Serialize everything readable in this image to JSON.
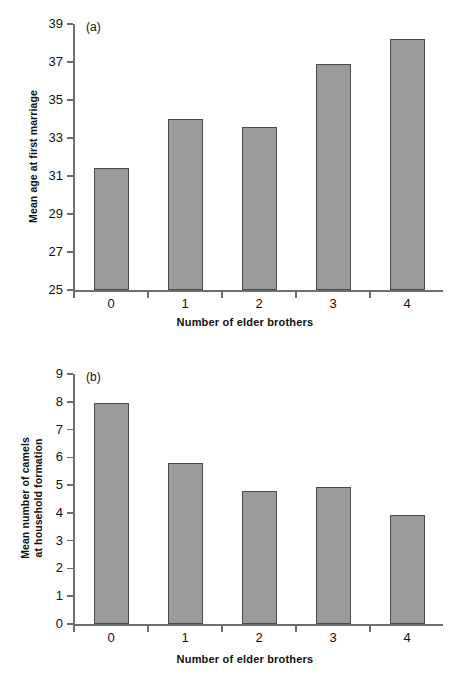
{
  "figure": {
    "panels": [
      {
        "tag": "(a)",
        "ytitle": "Mean age at first marriage",
        "xtitle": "Number of elder brothers"
      },
      {
        "tag": "(b)",
        "ytitle": "Mean number  of camels\nat household formation",
        "xtitle": "Number of elder brothers"
      }
    ]
  },
  "chart_data": [
    {
      "type": "bar",
      "panel": "(a)",
      "title": "",
      "xlabel": "Number of elder brothers",
      "ylabel": "Mean age at first marriage",
      "categories": [
        "0",
        "1",
        "2",
        "3",
        "4"
      ],
      "values": [
        31.4,
        34.0,
        33.6,
        36.9,
        38.2
      ],
      "ylim": [
        25,
        39
      ],
      "yticks": [
        25,
        27,
        29,
        31,
        33,
        35,
        37,
        39
      ],
      "ytick_labels": [
        "25",
        "27",
        "29",
        "31",
        "33",
        "35",
        "37",
        "39"
      ],
      "grid": false,
      "legend": "none",
      "bar_color": "#9b9b9b",
      "bar_edge_color": "#4a4a4a"
    },
    {
      "type": "bar",
      "panel": "(b)",
      "title": "",
      "xlabel": "Number of elder brothers",
      "ylabel": "Mean number of camels at household formation",
      "categories": [
        "0",
        "1",
        "2",
        "3",
        "4"
      ],
      "values": [
        7.95,
        5.8,
        4.8,
        4.95,
        3.93
      ],
      "ylim": [
        0,
        9
      ],
      "yticks": [
        0,
        1,
        2,
        3,
        4,
        5,
        6,
        7,
        8,
        9
      ],
      "ytick_labels": [
        "0",
        "1",
        "2",
        "3",
        "4",
        "5",
        "6",
        "7",
        "8",
        "9"
      ],
      "grid": false,
      "legend": "none",
      "bar_color": "#9b9b9b",
      "bar_edge_color": "#4a4a4a"
    }
  ]
}
